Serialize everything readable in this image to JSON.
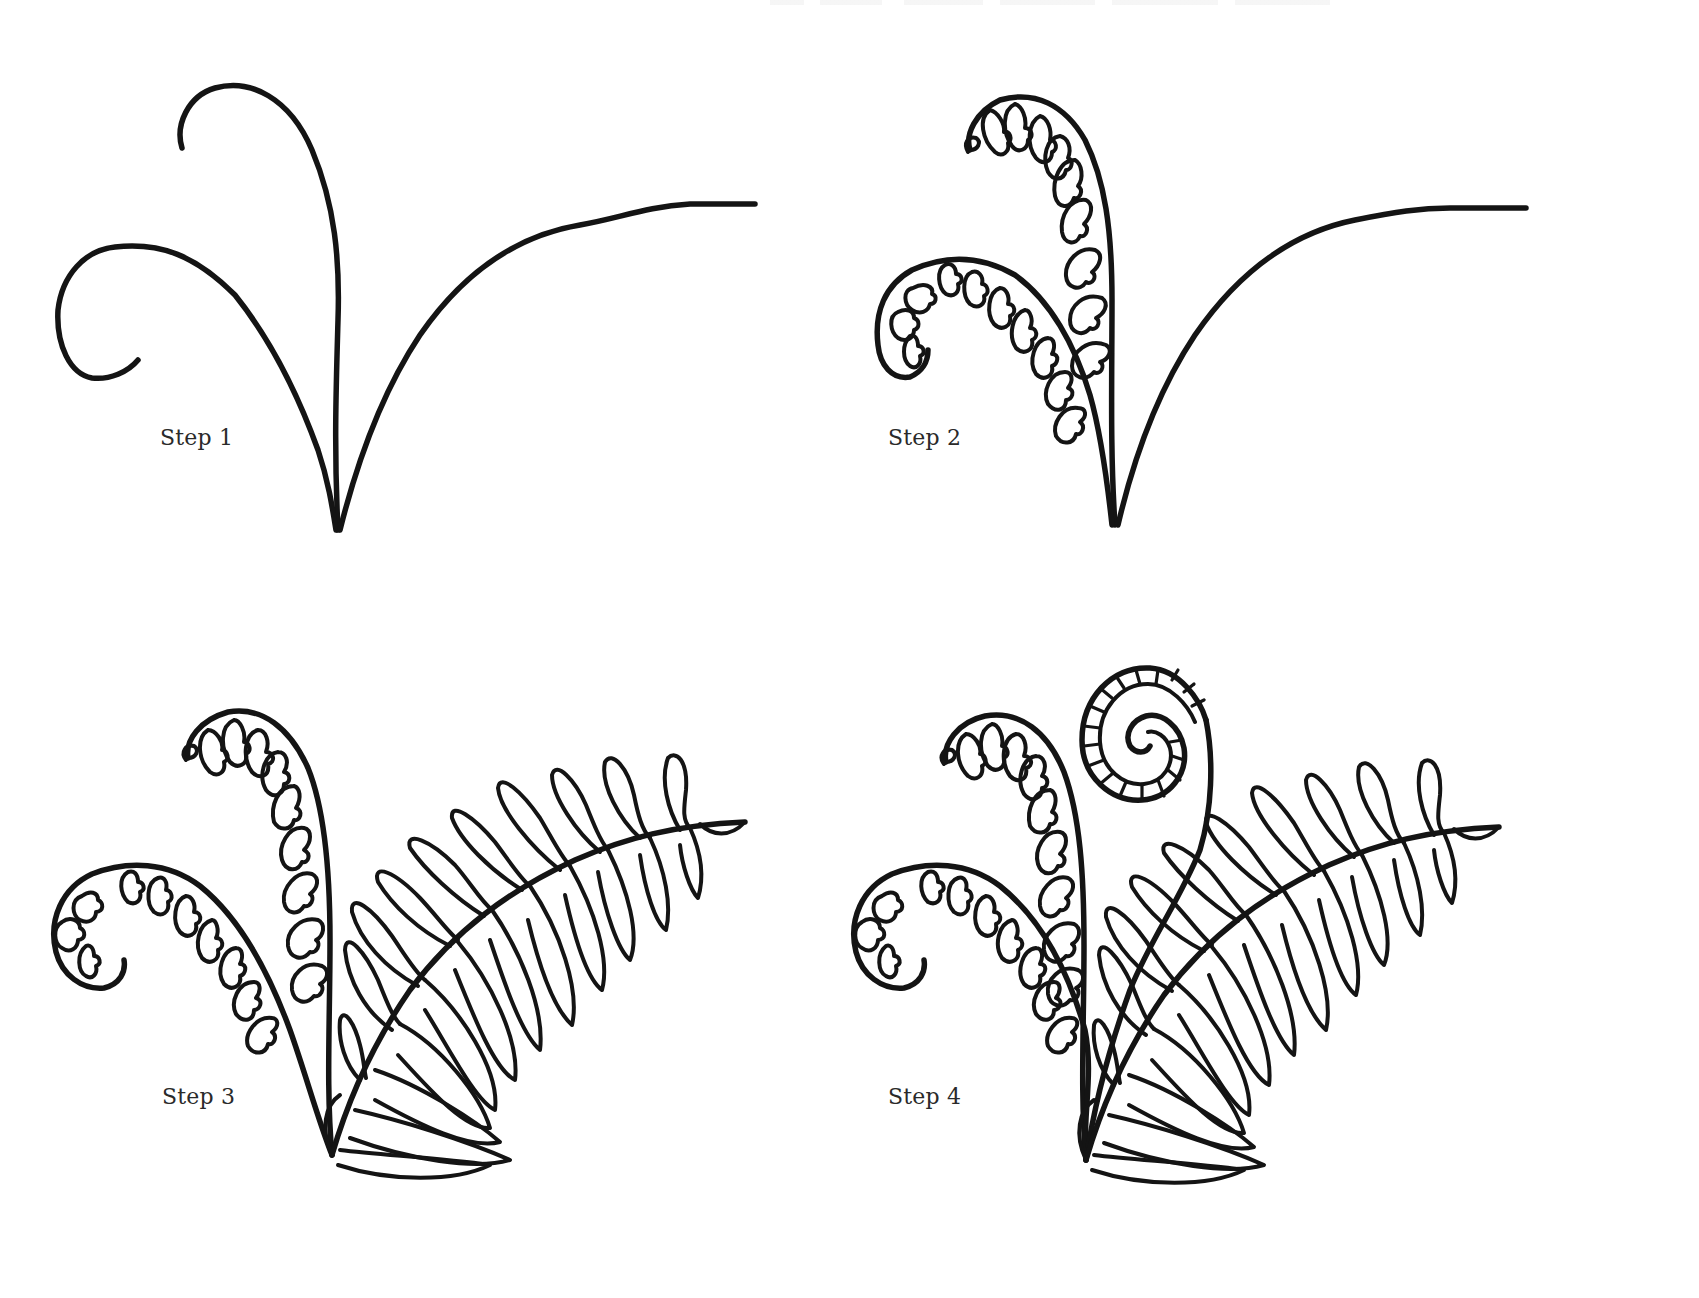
{
  "page": {
    "stroke_color": "#141414",
    "background": "#ffffff"
  },
  "steps": [
    {
      "id": 1,
      "label": "Step 1",
      "description": "Three curved stems from a single base point: a left curl, a tall center curl and a long right sweep"
    },
    {
      "id": 2,
      "label": "Step 2",
      "description": "Add small scalloped leaflets along the inner side of the left and center curled fronds"
    },
    {
      "id": 3,
      "label": "Step 3",
      "description": "Replace the right stem with a full frond with pointed leaflets on both sides"
    },
    {
      "id": 4,
      "label": "Step 4",
      "description": "Add a new tightly coiled fiddlehead with segmented stripes rising behind the frond"
    }
  ]
}
